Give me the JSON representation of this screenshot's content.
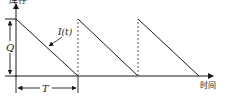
{
  "diagram": {
    "type": "inventory-sawtooth",
    "y_axis_label": "库存",
    "x_axis_label": "时间",
    "curve_label": "I(t)",
    "quantity_label": "Q",
    "period_label": "T",
    "cycles": 3,
    "colors": {
      "line": "#1a1a1a",
      "dashed": "#555555",
      "background": "#ffffff"
    }
  }
}
